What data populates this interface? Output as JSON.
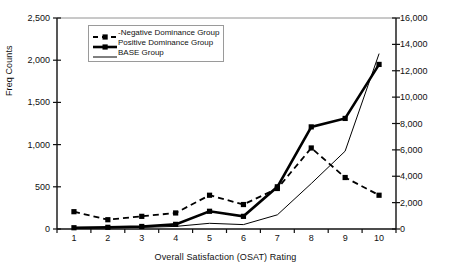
{
  "chart_data": {
    "type": "line",
    "title": "",
    "xlabel": "Overall Satisfaction (OSAT) Rating",
    "ylabel": "Freq Counts",
    "ylabel_secondary": "Freq Counts (BASE)",
    "categories": [
      "1",
      "2",
      "3",
      "4",
      "5",
      "6",
      "7",
      "8",
      "9",
      "10"
    ],
    "ylim": [
      0,
      2500
    ],
    "yticks": [
      "0",
      "500",
      "1,000",
      "1,500",
      "2,000",
      "2,500"
    ],
    "ytick_values": [
      0,
      500,
      1000,
      1500,
      2000,
      2500
    ],
    "ylim_secondary": [
      0,
      16000
    ],
    "yticks_secondary": [
      "0",
      "2,000",
      "4,000",
      "6,000",
      "8,000",
      "10,000",
      "12,000",
      "14,000",
      "16,000"
    ],
    "ytick_values_secondary": [
      0,
      2000,
      4000,
      6000,
      8000,
      10000,
      12000,
      14000,
      16000
    ],
    "grid": false,
    "legend_position": "upper-left-inside",
    "series": [
      {
        "name": "-Negative Dominance Group",
        "axis": "left",
        "style": "dashed",
        "marker": "square",
        "color": "#000000",
        "values": [
          205,
          110,
          150,
          190,
          400,
          290,
          480,
          960,
          610,
          400
        ]
      },
      {
        "name": "Positive Dominance Group",
        "axis": "left",
        "style": "solid-thick",
        "marker": "square",
        "color": "#000000",
        "values": [
          15,
          20,
          30,
          55,
          210,
          150,
          500,
          1210,
          1310,
          1950
        ]
      },
      {
        "name": "BASE Group",
        "axis": "right",
        "style": "solid-thin",
        "marker": "none",
        "color": "#000000",
        "values": [
          60,
          80,
          120,
          200,
          430,
          330,
          1080,
          3450,
          5900,
          13300
        ]
      }
    ]
  }
}
